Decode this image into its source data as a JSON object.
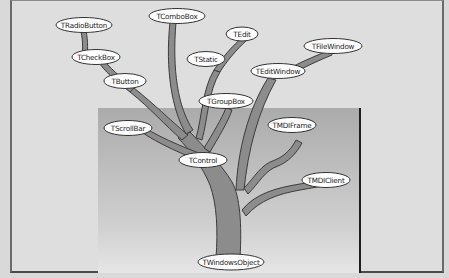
{
  "diagram": {
    "type": "class-hierarchy-tree",
    "root": "TWindowsObject",
    "colors": {
      "background": "#dedede",
      "inset_top": "#ababab",
      "inset_bottom": "#e6e6e6",
      "branch_fill": "#8c8c8c",
      "branch_outline": "#3c3c3c",
      "node_fill": "#ffffff",
      "node_outline": "#333333"
    },
    "nodes": [
      {
        "id": "twindowsobject",
        "label": "TWindowsObject",
        "parent": null
      },
      {
        "id": "tcontrol",
        "label": "TControl",
        "parent": "TWindowsObject"
      },
      {
        "id": "tmdiclient",
        "label": "TMDIClient",
        "parent": "TWindowsObject"
      },
      {
        "id": "tmdiframe",
        "label": "TMDIFrame",
        "parent": "TWindowsObject"
      },
      {
        "id": "teditwindow",
        "label": "TEditWindow",
        "parent": "TWindowsObject"
      },
      {
        "id": "tfilewindow",
        "label": "TFileWindow",
        "parent": "TEditWindow"
      },
      {
        "id": "tscrollbar",
        "label": "TScrollBar",
        "parent": "TControl"
      },
      {
        "id": "tbutton",
        "label": "TButton",
        "parent": "TControl"
      },
      {
        "id": "tcheckbox",
        "label": "TCheckBox",
        "parent": "TButton"
      },
      {
        "id": "tradiobutton",
        "label": "TRadioButton",
        "parent": "TCheckBox"
      },
      {
        "id": "tcombobox",
        "label": "TComboBox",
        "parent": "TControl"
      },
      {
        "id": "tstatic",
        "label": "TStatic",
        "parent": "TControl"
      },
      {
        "id": "tedit",
        "label": "TEdit",
        "parent": "TStatic"
      },
      {
        "id": "tgroupbox",
        "label": "TGroupBox",
        "parent": "TControl"
      }
    ]
  }
}
